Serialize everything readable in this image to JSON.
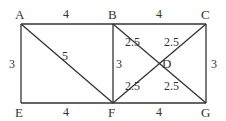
{
  "diagram": {
    "vertices": [
      {
        "id": "A",
        "label": "A",
        "x": 21,
        "y": 24
      },
      {
        "id": "B",
        "label": "B",
        "x": 113,
        "y": 24
      },
      {
        "id": "C",
        "label": "C",
        "x": 206,
        "y": 24
      },
      {
        "id": "D",
        "label": "D",
        "x": 159,
        "y": 63
      },
      {
        "id": "E",
        "label": "E",
        "x": 21,
        "y": 103
      },
      {
        "id": "F",
        "label": "F",
        "x": 113,
        "y": 103
      },
      {
        "id": "G",
        "label": "G",
        "x": 206,
        "y": 103
      }
    ],
    "edges": [
      {
        "from": "A",
        "to": "B",
        "length": "4"
      },
      {
        "from": "B",
        "to": "C",
        "length": "4"
      },
      {
        "from": "E",
        "to": "F",
        "length": "4"
      },
      {
        "from": "F",
        "to": "G",
        "length": "4"
      },
      {
        "from": "A",
        "to": "E",
        "length": "3"
      },
      {
        "from": "B",
        "to": "F",
        "length": "3"
      },
      {
        "from": "C",
        "to": "G",
        "length": "3"
      },
      {
        "from": "A",
        "to": "F",
        "length": "5"
      },
      {
        "from": "B",
        "to": "D",
        "length": "2.5"
      },
      {
        "from": "C",
        "to": "D",
        "length": "2.5"
      },
      {
        "from": "F",
        "to": "D",
        "length": "2.5"
      },
      {
        "from": "G",
        "to": "D",
        "length": "2.5"
      }
    ],
    "labels": {
      "A": "A",
      "B": "B",
      "C": "C",
      "D": "D",
      "E": "E",
      "F": "F",
      "G": "G",
      "ab": "4",
      "bc": "4",
      "ef": "4",
      "fg": "4",
      "ae": "3",
      "bf": "3",
      "cg": "3",
      "af": "5",
      "bd": "2.5",
      "cd": "2.5",
      "fd": "2.5",
      "gd": "2.5"
    }
  }
}
